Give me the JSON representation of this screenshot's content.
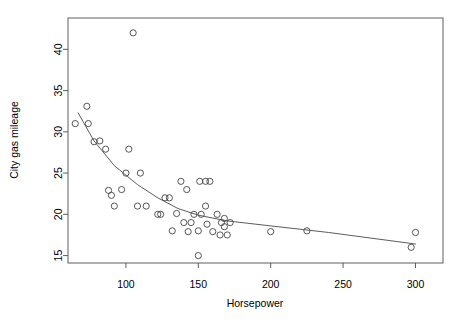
{
  "chart_data": {
    "type": "scatter",
    "title": "",
    "xlabel": "Horsepower",
    "ylabel": "City gas mileage",
    "xlim": [
      60,
      319
    ],
    "ylim": [
      14.1,
      43.8
    ],
    "xticks": [
      100,
      150,
      200,
      250,
      300
    ],
    "yticks": [
      15,
      20,
      25,
      30,
      35,
      40
    ],
    "grid": false,
    "legend": null,
    "marker": "open-circle",
    "points": [
      {
        "x": 65,
        "y": 31.0
      },
      {
        "x": 73,
        "y": 33.1
      },
      {
        "x": 74,
        "y": 31.0
      },
      {
        "x": 78,
        "y": 28.8
      },
      {
        "x": 82,
        "y": 28.9
      },
      {
        "x": 86,
        "y": 27.9
      },
      {
        "x": 88,
        "y": 22.9
      },
      {
        "x": 90,
        "y": 22.3
      },
      {
        "x": 92,
        "y": 21.0
      },
      {
        "x": 97,
        "y": 23.0
      },
      {
        "x": 100,
        "y": 25.0
      },
      {
        "x": 102,
        "y": 27.9
      },
      {
        "x": 105,
        "y": 42.0
      },
      {
        "x": 108,
        "y": 21.0
      },
      {
        "x": 110,
        "y": 25.0
      },
      {
        "x": 114,
        "y": 21.0
      },
      {
        "x": 122,
        "y": 20.0
      },
      {
        "x": 124,
        "y": 20.0
      },
      {
        "x": 127,
        "y": 22.0
      },
      {
        "x": 130,
        "y": 22.0
      },
      {
        "x": 132,
        "y": 18.0
      },
      {
        "x": 135,
        "y": 20.1
      },
      {
        "x": 138,
        "y": 24.0
      },
      {
        "x": 142,
        "y": 23.0
      },
      {
        "x": 145,
        "y": 19.0
      },
      {
        "x": 147,
        "y": 20.0
      },
      {
        "x": 150,
        "y": 15.0
      },
      {
        "x": 151,
        "y": 24.0
      },
      {
        "x": 155,
        "y": 24.0
      },
      {
        "x": 158,
        "y": 24.0
      },
      {
        "x": 152,
        "y": 20.0
      },
      {
        "x": 156,
        "y": 18.8
      },
      {
        "x": 160,
        "y": 17.9
      },
      {
        "x": 150,
        "y": 18.0
      },
      {
        "x": 155,
        "y": 21.0
      },
      {
        "x": 163,
        "y": 20.0
      },
      {
        "x": 166,
        "y": 19.0
      },
      {
        "x": 168,
        "y": 19.5
      },
      {
        "x": 168,
        "y": 18.5
      },
      {
        "x": 170,
        "y": 17.5
      },
      {
        "x": 172,
        "y": 19.0
      },
      {
        "x": 165,
        "y": 17.5
      },
      {
        "x": 143,
        "y": 17.9
      },
      {
        "x": 140,
        "y": 19.0
      },
      {
        "x": 200,
        "y": 17.9
      },
      {
        "x": 225,
        "y": 18.0
      },
      {
        "x": 297,
        "y": 16.0
      },
      {
        "x": 300,
        "y": 17.8
      }
    ],
    "fit_line": {
      "name": "lowess-smoother",
      "points": [
        {
          "x": 67,
          "y": 32.3
        },
        {
          "x": 78,
          "y": 28.9
        },
        {
          "x": 92,
          "y": 25.9
        },
        {
          "x": 108,
          "y": 23.6
        },
        {
          "x": 122,
          "y": 22.0
        },
        {
          "x": 136,
          "y": 20.7
        },
        {
          "x": 150,
          "y": 19.9
        },
        {
          "x": 170,
          "y": 19.2
        },
        {
          "x": 200,
          "y": 18.6
        },
        {
          "x": 240,
          "y": 17.8
        },
        {
          "x": 300,
          "y": 16.4
        }
      ]
    }
  },
  "axes": {
    "x_title": "Horsepower",
    "y_title": "City gas mileage",
    "x_tick_labels": [
      "100",
      "150",
      "200",
      "250",
      "300"
    ],
    "y_tick_labels": [
      "15",
      "20",
      "25",
      "30",
      "35",
      "40"
    ]
  },
  "style": {
    "background": "#ffffff",
    "axis_color": "#4d4d4d",
    "point_color": "#3a3a3a",
    "line_color": "#4a4a4a"
  }
}
